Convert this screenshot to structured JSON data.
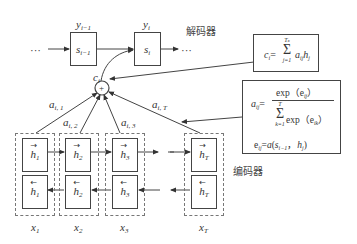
{
  "decoder": {
    "label": "解码器",
    "ellipsis_left": "···",
    "ellipsis_right": "···",
    "states": [
      {
        "name": "s",
        "sub": "i−1",
        "output_name": "y",
        "output_sub": "i−1"
      },
      {
        "name": "s",
        "sub": "i",
        "output_name": "y",
        "output_sub": "i"
      }
    ]
  },
  "context": {
    "symbol": "+",
    "label_name": "c",
    "label_sub": "i"
  },
  "attention_weights": [
    {
      "name": "a",
      "sub": "i, 1"
    },
    {
      "name": "a",
      "sub": "i, 2"
    },
    {
      "name": "a",
      "sub": "i, 3"
    },
    {
      "name": "a",
      "sub": "i, T"
    }
  ],
  "formula_context": {
    "lhs": "c",
    "lhs_sub": "i",
    "eq": "=",
    "sum_upper": "T",
    "sum_upper_sub": "x",
    "sum_lower": "j=1",
    "term": "a",
    "term_sub": "ij",
    "term2": "h",
    "term2_sub": "j"
  },
  "formula_attention": {
    "lhs": "a",
    "lhs_sub": "ij",
    "eq": "=",
    "numerator": "exp（e",
    "numerator_sub": "ij",
    "numerator_close": "）",
    "sum_upper": "T",
    "sum_lower": "k=1",
    "denominator": "exp（e",
    "denominator_sub": "ik",
    "denominator_close": "）",
    "energy_lhs": "e",
    "energy_lhs_sub": "ij",
    "energy_eq": "=",
    "energy_rhs_fn": "a",
    "energy_rhs_open": "(",
    "energy_rhs_s": "s",
    "energy_rhs_s_sub": "i−1",
    "energy_rhs_sep": "，",
    "energy_rhs_h": "h",
    "energy_rhs_h_sub": "j",
    "energy_rhs_close": ")"
  },
  "encoder": {
    "label": "编码器",
    "columns": [
      {
        "forward": "h",
        "forward_sub": "1",
        "backward": "h",
        "backward_sub": "1",
        "input": "x",
        "input_sub": "1"
      },
      {
        "forward": "h",
        "forward_sub": "2",
        "backward": "h",
        "backward_sub": "2",
        "input": "x",
        "input_sub": "2"
      },
      {
        "forward": "h",
        "forward_sub": "3",
        "backward": "h",
        "backward_sub": "3",
        "input": "x",
        "input_sub": "3"
      },
      {
        "forward": "h",
        "forward_sub": "T",
        "backward": "h",
        "backward_sub": "T",
        "input": "x",
        "input_sub": "T"
      }
    ],
    "arrow_right": "→",
    "arrow_left": "←"
  }
}
